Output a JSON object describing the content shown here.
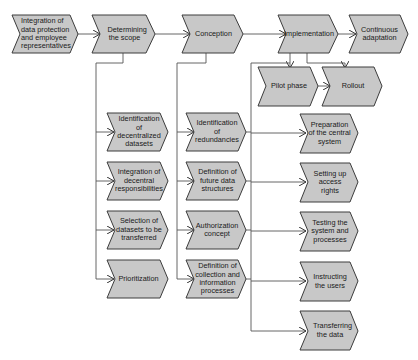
{
  "diagram": {
    "colors": {
      "fill": "#c8c8c8",
      "stroke": "#3c3c3c",
      "line": "#555555",
      "background": "#ffffff"
    },
    "top_row": [
      {
        "id": "n1",
        "label": "Integration of data protection and employee representatives",
        "shape": "start-chevron"
      },
      {
        "id": "n2",
        "label": "Determining the scope",
        "shape": "chevron"
      },
      {
        "id": "n3",
        "label": "Conception",
        "shape": "chevron"
      },
      {
        "id": "n4",
        "label": "Implementation",
        "shape": "chevron"
      },
      {
        "id": "n5",
        "label": "Continuous adaptation",
        "shape": "chevron"
      }
    ],
    "implementation_sub": [
      {
        "id": "p1",
        "label": "Pilot phase"
      },
      {
        "id": "p2",
        "label": "Rollout"
      }
    ],
    "scope_steps": [
      {
        "label": "Identification of decentralized datasets"
      },
      {
        "label": "Integration of decentral responsibilities"
      },
      {
        "label": "Selection of datasets to be transferred"
      },
      {
        "label": "Prioritization"
      }
    ],
    "conception_steps": [
      {
        "label": "Identification of redundancies"
      },
      {
        "label": "Definition of future data structures"
      },
      {
        "label": "Authorization concept"
      },
      {
        "label": "Definition of collection and information processes"
      }
    ],
    "implementation_steps": [
      {
        "label": "Preparation of the central system"
      },
      {
        "label": "Setting up access rights"
      },
      {
        "label": "Testing the system and processes"
      },
      {
        "label": "Instructing the users"
      },
      {
        "label": "Transferring the data"
      }
    ]
  }
}
